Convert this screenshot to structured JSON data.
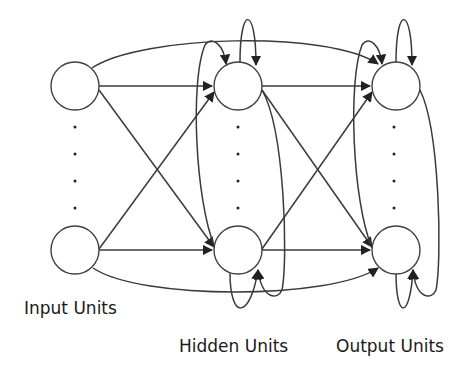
{
  "diagram": {
    "type": "recurrent-neural-network",
    "layers": [
      {
        "id": "input",
        "label": "Input Units",
        "nodes": 2,
        "ellipsis_dots": 4
      },
      {
        "id": "hidden",
        "label": "Hidden Units",
        "nodes": 2,
        "ellipsis_dots": 4
      },
      {
        "id": "output",
        "label": "Output Units",
        "nodes": 2,
        "ellipsis_dots": 4
      }
    ],
    "connections": [
      "input -> hidden (full, including crossing)",
      "hidden -> output (full, including crossing)",
      "input -> output (skip arcs top and bottom)",
      "hidden self-loops",
      "output self-loops",
      "hidden lateral recurrent loops",
      "output lateral recurrent loops"
    ],
    "colors": {
      "stroke": "#3a3a3a",
      "background": "#ffffff"
    }
  },
  "labels": {
    "input": "Input Units",
    "hidden": "Hidden Units",
    "output": "Output Units"
  }
}
